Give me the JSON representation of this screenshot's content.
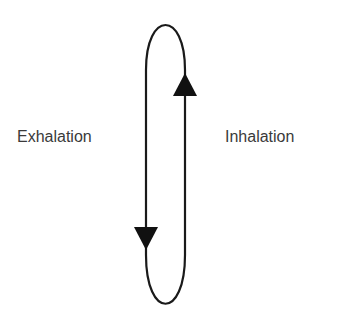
{
  "diagram": {
    "type": "breathing-cycle-loop",
    "labels": {
      "left": "Exhalation",
      "right": "Inhalation"
    },
    "arrows": {
      "left_side": "down",
      "right_side": "up"
    },
    "colors": {
      "stroke": "#1a1a1a",
      "text": "#3a3a3a",
      "background": "#ffffff"
    }
  }
}
